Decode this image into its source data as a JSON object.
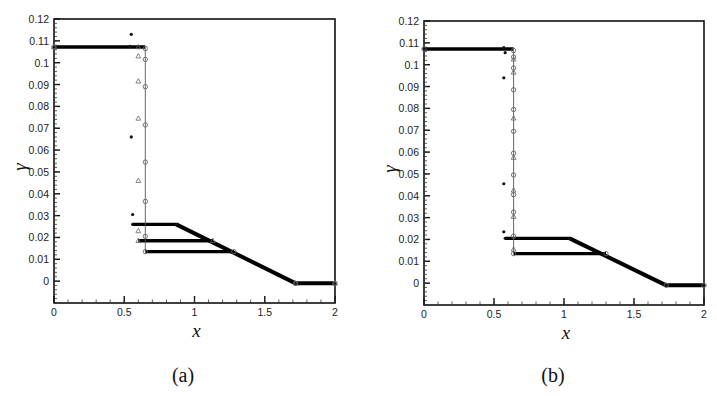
{
  "figure": {
    "captions": [
      "(a)",
      "(b)"
    ]
  },
  "chart_data": [
    {
      "type": "scatter",
      "panel": "(a)",
      "title": "",
      "xlabel": "x",
      "ylabel": "γ",
      "xlim": [
        0,
        2
      ],
      "ylim": [
        -0.01,
        0.12
      ],
      "xticks": [
        0,
        0.5,
        1,
        1.5,
        2
      ],
      "xtick_labels": [
        "0",
        "0.5",
        "1",
        "1.5",
        "2"
      ],
      "yticks": [
        0,
        0.01,
        0.02,
        0.03,
        0.04,
        0.05,
        0.06,
        0.07,
        0.08,
        0.09,
        0.1,
        0.11,
        0.12
      ],
      "ytick_labels": [
        "0",
        "0.01",
        "0.02",
        "0.03",
        "0.04",
        "0.05",
        "0.06",
        "0.07",
        "0.08",
        "0.09",
        "0.1",
        "0.11",
        "0.12"
      ],
      "grid": false,
      "legend": null,
      "series": [
        {
          "name": "star markers",
          "marker": "star",
          "x": [
            0,
            0.54,
            0.55,
            0.56,
            0.57,
            0.87,
            1.72,
            2.0
          ],
          "y": [
            0.1072,
            0.1075,
            0.113,
            0.066,
            0.0305,
            0.026,
            0.026,
            -0.001,
            -0.001
          ],
          "plateau": {
            "x_start": 0.56,
            "x_end": 0.87,
            "y": 0.026
          },
          "points": [
            [
              0,
              0.1072
            ],
            [
              0.54,
              0.1075
            ],
            [
              0.55,
              0.113
            ],
            [
              0.55,
              0.066
            ],
            [
              0.56,
              0.0305
            ],
            [
              0.56,
              0.026
            ],
            [
              0.87,
              0.026
            ],
            [
              1.72,
              -0.001
            ],
            [
              2.0,
              -0.001
            ]
          ]
        },
        {
          "name": "triangle markers",
          "marker": "triangle",
          "plateau": {
            "x_start": 0.6,
            "x_end": 1.13,
            "y": 0.0185
          },
          "points": [
            [
              0,
              0.1072
            ],
            [
              0.6,
              0.1072
            ],
            [
              0.6,
              0.103
            ],
            [
              0.6,
              0.0915
            ],
            [
              0.6,
              0.0745
            ],
            [
              0.6,
              0.046
            ],
            [
              0.6,
              0.023
            ],
            [
              0.6,
              0.0185
            ],
            [
              1.13,
              0.0185
            ],
            [
              1.72,
              -0.001
            ],
            [
              2.0,
              -0.001
            ]
          ]
        },
        {
          "name": "circle markers",
          "marker": "circle",
          "plateau": {
            "x_start": 0.65,
            "x_end": 1.28,
            "y": 0.0135
          },
          "points": [
            [
              0,
              0.1072
            ],
            [
              0.65,
              0.1065
            ],
            [
              0.65,
              0.1015
            ],
            [
              0.65,
              0.089
            ],
            [
              0.65,
              0.0715
            ],
            [
              0.65,
              0.0545
            ],
            [
              0.65,
              0.0365
            ],
            [
              0.65,
              0.0205
            ],
            [
              0.65,
              0.0135
            ],
            [
              1.28,
              0.0135
            ],
            [
              1.72,
              -0.001
            ],
            [
              2.0,
              -0.001
            ]
          ]
        },
        {
          "name": "reference line",
          "marker": "line",
          "points": [
            [
              0.65,
              0.1065
            ],
            [
              0.65,
              0.0135
            ]
          ]
        }
      ],
      "shared_tail": {
        "slope_start": [
          0.87,
          0.026
        ],
        "slope_end": [
          1.72,
          -0.001
        ],
        "tail_y": -0.001
      }
    },
    {
      "type": "scatter",
      "panel": "(b)",
      "title": "",
      "xlabel": "x",
      "ylabel": "γ",
      "xlim": [
        0,
        2
      ],
      "ylim": [
        -0.01,
        0.12
      ],
      "xticks": [
        0,
        0.5,
        1,
        1.5,
        2
      ],
      "xtick_labels": [
        "0",
        "0.5",
        "1",
        "1.5",
        "2"
      ],
      "yticks": [
        0,
        0.01,
        0.02,
        0.03,
        0.04,
        0.05,
        0.06,
        0.07,
        0.08,
        0.09,
        0.1,
        0.11,
        0.12
      ],
      "ytick_labels": [
        "0",
        "0.01",
        "0.02",
        "0.03",
        "0.04",
        "0.05",
        "0.06",
        "0.07",
        "0.08",
        "0.09",
        "0.1",
        "0.11",
        "0.12"
      ],
      "grid": false,
      "legend": null,
      "series": [
        {
          "name": "star markers",
          "marker": "star",
          "plateau": {
            "x_start": 0.58,
            "x_end": 1.04,
            "y": 0.0205
          },
          "points": [
            [
              0,
              0.1072
            ],
            [
              0.57,
              0.1078
            ],
            [
              0.58,
              0.1055
            ],
            [
              0.57,
              0.094
            ],
            [
              0.57,
              0.0455
            ],
            [
              0.57,
              0.0235
            ],
            [
              0.58,
              0.0205
            ],
            [
              1.04,
              0.0205
            ],
            [
              1.73,
              -0.001
            ],
            [
              2.0,
              -0.001
            ]
          ]
        },
        {
          "name": "triangle markers",
          "marker": "triangle",
          "points": [
            [
              0.64,
              0.1025
            ],
            [
              0.64,
              0.0965
            ],
            [
              0.64,
              0.0755
            ],
            [
              0.64,
              0.0575
            ],
            [
              0.64,
              0.0425
            ],
            [
              0.64,
              0.0305
            ],
            [
              0.64,
              0.0155
            ]
          ]
        },
        {
          "name": "circle markers",
          "marker": "circle",
          "plateau": {
            "x_start": 0.64,
            "x_end": 1.3,
            "y": 0.0135
          },
          "points": [
            [
              0,
              0.1072
            ],
            [
              0.64,
              0.1065
            ],
            [
              0.64,
              0.1035
            ],
            [
              0.64,
              0.0985
            ],
            [
              0.64,
              0.0885
            ],
            [
              0.64,
              0.0795
            ],
            [
              0.64,
              0.0695
            ],
            [
              0.64,
              0.0595
            ],
            [
              0.64,
              0.0495
            ],
            [
              0.64,
              0.0405
            ],
            [
              0.64,
              0.0325
            ],
            [
              0.64,
              0.0215
            ],
            [
              0.64,
              0.0135
            ],
            [
              1.3,
              0.0135
            ],
            [
              1.73,
              -0.001
            ],
            [
              2.0,
              -0.001
            ]
          ]
        },
        {
          "name": "reference line",
          "marker": "line",
          "points": [
            [
              0.64,
              0.1065
            ],
            [
              0.64,
              0.0135
            ]
          ]
        }
      ],
      "shared_tail": {
        "slope_start": [
          1.04,
          0.0205
        ],
        "slope_end": [
          1.73,
          -0.001
        ],
        "tail_y": -0.001
      }
    }
  ],
  "layout": {
    "panels": [
      {
        "left": 54,
        "right": 335,
        "top": 19,
        "bottom": 303,
        "caption_x": 183,
        "caption_y": 382
      },
      {
        "left": 424,
        "right": 704,
        "top": 21,
        "bottom": 305,
        "caption_x": 553,
        "caption_y": 382
      }
    ]
  }
}
